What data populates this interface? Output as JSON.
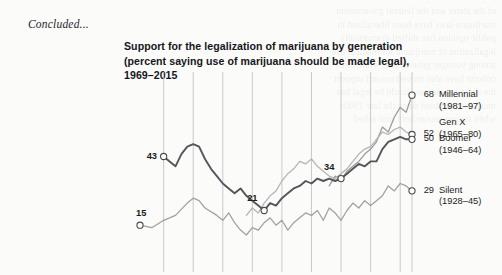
{
  "page": {
    "continuation_note": "Concluded...",
    "bleed_lines": [
      "of the states and the federal government",
      "marijuana laws have been liberalized in",
      "public opinion has shifted dramatically",
      "legalization of marijuana for medical use",
      "among younger generations, while older",
      "cohorts have also moved toward support",
      "the share saying use should be legal has",
      "more than doubled since the late 1960s",
      "when survey researchers first asked"
    ]
  },
  "chart_data": {
    "type": "line",
    "title": "Support for the legalization of marijuana by generation (percent saying use of marijuana should be made legal), 1969–2015",
    "xlabel": "",
    "ylabel": "",
    "x_range": [
      1969,
      2015
    ],
    "ylim": [
      0,
      75
    ],
    "grid": "vertical",
    "legend_position": "right-endpoint-labels",
    "series": [
      {
        "name": "Millennial",
        "birth_years": "(1981–97)",
        "color": "#9a9a9a",
        "end_value": 68,
        "start_year": 2001,
        "points": [
          [
            2001,
            31
          ],
          [
            2002,
            35
          ],
          [
            2003,
            33
          ],
          [
            2004,
            37
          ],
          [
            2005,
            39
          ],
          [
            2006,
            41
          ],
          [
            2007,
            44
          ],
          [
            2008,
            46
          ],
          [
            2009,
            49
          ],
          [
            2010,
            55
          ],
          [
            2011,
            53
          ],
          [
            2012,
            59
          ],
          [
            2013,
            63
          ],
          [
            2014,
            61
          ],
          [
            2015,
            68
          ]
        ]
      },
      {
        "name": "Gen X",
        "birth_years": "(1965–80)",
        "color": "#b4b4b4",
        "end_value": 52,
        "start_year": 1987,
        "points": [
          [
            1987,
            19
          ],
          [
            1988,
            22
          ],
          [
            1989,
            20
          ],
          [
            1990,
            24
          ],
          [
            1991,
            27
          ],
          [
            1992,
            29
          ],
          [
            1993,
            33
          ],
          [
            1994,
            36
          ],
          [
            1995,
            38
          ],
          [
            1996,
            41
          ],
          [
            1997,
            40
          ],
          [
            1998,
            42
          ],
          [
            1999,
            39
          ],
          [
            2000,
            37
          ],
          [
            2001,
            35
          ],
          [
            2002,
            34
          ],
          [
            2003,
            36
          ],
          [
            2004,
            38
          ],
          [
            2005,
            41
          ],
          [
            2006,
            44
          ],
          [
            2007,
            46
          ],
          [
            2008,
            47
          ],
          [
            2009,
            50
          ],
          [
            2010,
            53
          ],
          [
            2011,
            52
          ],
          [
            2012,
            54
          ],
          [
            2013,
            55
          ],
          [
            2014,
            53
          ],
          [
            2015,
            52
          ]
        ]
      },
      {
        "name": "Boomer",
        "birth_years": "(1946–64)",
        "color": "#55555a",
        "end_value": 50,
        "start_year": 1973,
        "labeled_points": [
          {
            "year": 1973,
            "value": 43
          },
          {
            "year": 1990,
            "value": 21
          },
          {
            "year": 2003,
            "value": 34
          }
        ],
        "points": [
          [
            1973,
            43
          ],
          [
            1974,
            41
          ],
          [
            1975,
            39
          ],
          [
            1976,
            44
          ],
          [
            1977,
            47
          ],
          [
            1978,
            48
          ],
          [
            1979,
            47
          ],
          [
            1980,
            42
          ],
          [
            1981,
            38
          ],
          [
            1982,
            35
          ],
          [
            1983,
            32
          ],
          [
            1984,
            30
          ],
          [
            1985,
            28
          ],
          [
            1986,
            30
          ],
          [
            1987,
            27
          ],
          [
            1988,
            25
          ],
          [
            1989,
            23
          ],
          [
            1990,
            21
          ],
          [
            1991,
            24
          ],
          [
            1992,
            23
          ],
          [
            1993,
            26
          ],
          [
            1994,
            28
          ],
          [
            1995,
            30
          ],
          [
            1996,
            31
          ],
          [
            1997,
            33
          ],
          [
            1998,
            32
          ],
          [
            1999,
            34
          ],
          [
            2000,
            33
          ],
          [
            2001,
            34
          ],
          [
            2002,
            33
          ],
          [
            2003,
            34
          ],
          [
            2004,
            36
          ],
          [
            2005,
            38
          ],
          [
            2006,
            40
          ],
          [
            2007,
            39
          ],
          [
            2008,
            41
          ],
          [
            2009,
            41
          ],
          [
            2010,
            46
          ],
          [
            2011,
            49
          ],
          [
            2012,
            50
          ],
          [
            2013,
            51
          ],
          [
            2014,
            50
          ],
          [
            2015,
            50
          ]
        ]
      },
      {
        "name": "Silent",
        "birth_years": "(1928–45)",
        "color": "#a0a0a0",
        "end_value": 29,
        "start_year": 1969,
        "labeled_points": [
          {
            "year": 1969,
            "value": 15
          }
        ],
        "points": [
          [
            1969,
            15
          ],
          [
            1971,
            14
          ],
          [
            1973,
            17
          ],
          [
            1975,
            19
          ],
          [
            1977,
            24
          ],
          [
            1978,
            26
          ],
          [
            1979,
            25
          ],
          [
            1980,
            22
          ],
          [
            1982,
            19
          ],
          [
            1983,
            17
          ],
          [
            1984,
            20
          ],
          [
            1985,
            16
          ],
          [
            1986,
            13
          ],
          [
            1987,
            11
          ],
          [
            1988,
            14
          ],
          [
            1989,
            13
          ],
          [
            1990,
            16
          ],
          [
            1991,
            18
          ],
          [
            1992,
            15
          ],
          [
            1993,
            17
          ],
          [
            1994,
            13
          ],
          [
            1995,
            16
          ],
          [
            1996,
            18
          ],
          [
            1997,
            20
          ],
          [
            1998,
            19
          ],
          [
            1999,
            21
          ],
          [
            2000,
            17
          ],
          [
            2001,
            22
          ],
          [
            2002,
            20
          ],
          [
            2003,
            17
          ],
          [
            2004,
            21
          ],
          [
            2005,
            24
          ],
          [
            2006,
            22
          ],
          [
            2007,
            25
          ],
          [
            2008,
            23
          ],
          [
            2009,
            25
          ],
          [
            2010,
            27
          ],
          [
            2011,
            31
          ],
          [
            2012,
            29
          ],
          [
            2013,
            32
          ],
          [
            2014,
            31
          ],
          [
            2015,
            29
          ]
        ]
      }
    ],
    "gridline_years": [
      1973,
      1978,
      1983,
      1988,
      1993,
      1998,
      2003,
      2008,
      2013,
      2015
    ]
  }
}
